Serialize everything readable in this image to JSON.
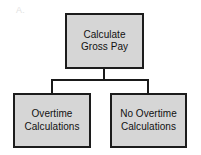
{
  "figure": {
    "label": "A.",
    "background_color": "#ffffff",
    "node_fill_color": "#d6d6d6",
    "node_border_color": "#1c1c1c",
    "connector_color": "#1a1a1a",
    "text_color": "#111111"
  },
  "chart_data": {
    "type": "diagram",
    "diagram_type": "flowchart-tree",
    "title": "",
    "nodes": [
      {
        "id": "root",
        "label": "Calculate\nGross Pay",
        "level": 0
      },
      {
        "id": "left",
        "label": "Overtime\nCalculations",
        "level": 1
      },
      {
        "id": "right",
        "label": "No Overtime\nCalculations",
        "level": 1
      }
    ],
    "edges": [
      {
        "from": "root",
        "to": "left",
        "style": "orthogonal"
      },
      {
        "from": "root",
        "to": "right",
        "style": "orthogonal"
      }
    ]
  },
  "nodes": {
    "root": {
      "label": "Calculate\nGross Pay"
    },
    "left": {
      "label": "Overtime\nCalculations"
    },
    "right": {
      "label": "No Overtime\nCalculations"
    }
  }
}
